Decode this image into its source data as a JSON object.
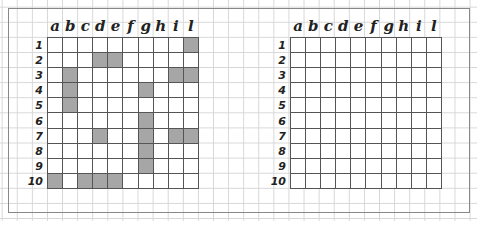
{
  "boards": [
    {
      "name": "left",
      "columns": [
        "a",
        "b",
        "c",
        "d",
        "e",
        "f",
        "g",
        "h",
        "i",
        "l"
      ],
      "rows": [
        "1",
        "2",
        "3",
        "4",
        "5",
        "6",
        "7",
        "8",
        "9",
        "10"
      ],
      "filled_cells": [
        "l1",
        "d2",
        "e2",
        "b3",
        "i3",
        "l3",
        "b4",
        "g4",
        "b5",
        "g6",
        "d7",
        "g7",
        "i7",
        "l7",
        "g8",
        "g9",
        "a10",
        "c10",
        "d10",
        "e10"
      ]
    },
    {
      "name": "right",
      "columns": [
        "a",
        "b",
        "c",
        "d",
        "e",
        "f",
        "g",
        "h",
        "i",
        "l"
      ],
      "rows": [
        "1",
        "2",
        "3",
        "4",
        "5",
        "6",
        "7",
        "8",
        "9",
        "10"
      ],
      "filled_cells": []
    }
  ],
  "colors": {
    "filled_cell": "#a6a6a6",
    "grid_line": "#555555",
    "paper_line": "#d6d6d6"
  }
}
